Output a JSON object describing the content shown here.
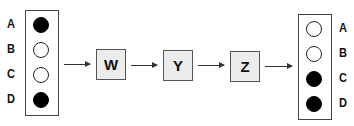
{
  "diagram": {
    "input_panel": {
      "rows": [
        {
          "label": "A",
          "state": "filled"
        },
        {
          "label": "B",
          "state": "empty"
        },
        {
          "label": "C",
          "state": "empty"
        },
        {
          "label": "D",
          "state": "filled"
        }
      ]
    },
    "stages": [
      {
        "label": "W"
      },
      {
        "label": "Y"
      },
      {
        "label": "Z"
      }
    ],
    "output_panel": {
      "rows": [
        {
          "label": "A",
          "state": "empty"
        },
        {
          "label": "B",
          "state": "empty"
        },
        {
          "label": "C",
          "state": "filled"
        },
        {
          "label": "D",
          "state": "filled"
        }
      ]
    },
    "colors": {
      "filled": "#000000",
      "empty": "#ffffff",
      "stage_fill": "#ececec",
      "border": "#444444"
    }
  }
}
